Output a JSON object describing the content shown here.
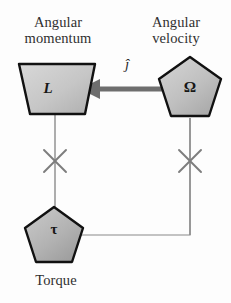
{
  "diagram": {
    "background_color": "#fdfdfd",
    "nodes": [
      {
        "id": "angular-momentum",
        "label": "Angular\nmomentum",
        "symbol": "L",
        "shape": "trapezoid",
        "fill_color": "#c9c9c9",
        "stroke_color": "#111111"
      },
      {
        "id": "angular-velocity",
        "label": "Angular\nvelocity",
        "symbol": "Ω",
        "shape": "pentagon",
        "fill_color": "#c2c2c2",
        "stroke_color": "#111111"
      },
      {
        "id": "torque",
        "label": "Torque",
        "symbol": "τ",
        "shape": "pentagon",
        "fill_color": "#b4b4b4",
        "stroke_color": "#111111"
      }
    ],
    "edges": [
      {
        "id": "omega-to-L",
        "from": "angular-velocity",
        "to": "angular-momentum",
        "style": "thick-arrow",
        "arrowhead": "left",
        "label": "ĵ",
        "color": "#6e6e6e",
        "blocked": false
      },
      {
        "id": "L-to-torque",
        "from": "angular-momentum",
        "to": "torque",
        "style": "thin-line",
        "arrowhead": "none",
        "marker": "x-cross",
        "color": "#8a8a8a",
        "blocked": true
      },
      {
        "id": "omega-to-torque",
        "from": "angular-velocity",
        "to": "torque",
        "style": "thin-line",
        "arrowhead": "none",
        "marker": "x-cross",
        "color": "#8a8a8a",
        "blocked": true
      },
      {
        "id": "torque-to-omega-return",
        "from": "torque",
        "to": "angular-velocity",
        "style": "thin-line",
        "arrowhead": "none",
        "color": "#8a8a8a",
        "blocked": false
      }
    ]
  }
}
